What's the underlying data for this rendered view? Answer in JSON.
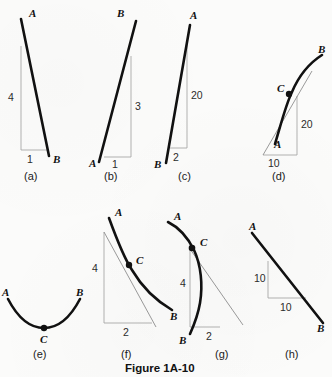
{
  "figure": {
    "caption": "Figure 1A-10",
    "background_color": "#fbfbfa",
    "ink_color": "#111111",
    "guide_color": "#a8a8a8"
  },
  "panels": [
    {
      "id": "a",
      "label": "(a)",
      "kind": "straight-line",
      "point_a": "A",
      "point_b": "B",
      "rise_label": "4",
      "run_label": "1",
      "description": "Steep line falling from A at upper left to B at lower right with rise-over-run triangle"
    },
    {
      "id": "b",
      "label": "(b)",
      "kind": "straight-line",
      "point_a": "A",
      "point_b": "B",
      "rise_label": "3",
      "run_label": "1",
      "description": "Steep line rising from A at lower left to B at upper right with rise-over-run triangle"
    },
    {
      "id": "c",
      "label": "(c)",
      "kind": "straight-line",
      "point_a": "A",
      "point_b": "B",
      "rise_label": "20",
      "run_label": "2",
      "description": "Very steep line from A at top to B at lower left with rise-over-run triangle"
    },
    {
      "id": "d",
      "label": "(d)",
      "kind": "curve-with-tangent",
      "point_a": "A",
      "point_b": "B",
      "point_c": "C",
      "rise_label": "20",
      "run_label": "10",
      "description": "Concave curve from A at lower left rising to B at upper right, tangent drawn at point C"
    },
    {
      "id": "e",
      "label": "(e)",
      "kind": "curve-minimum",
      "point_a": "A",
      "point_b": "B",
      "point_c": "C",
      "rise_label": "",
      "run_label": "",
      "description": "U-shaped valley curve from A to B with minimum point C, no measurement triangle"
    },
    {
      "id": "f",
      "label": "(f)",
      "kind": "curve-with-tangent",
      "point_a": "A",
      "point_b": "B",
      "point_c": "C",
      "rise_label": "4",
      "run_label": "2",
      "description": "Convex decreasing curve from A at upper left to B at lower right, tangent at point C"
    },
    {
      "id": "g",
      "label": "(g)",
      "kind": "curve-with-tangent",
      "point_a": "A",
      "point_b": "B",
      "point_c": "C",
      "rise_label": "4",
      "run_label": "2",
      "description": "Steeply falling curve from A at upper left through C down to B at bottom, tangent at point C"
    },
    {
      "id": "h",
      "label": "(h)",
      "kind": "straight-line",
      "point_a": "A",
      "point_b": "B",
      "rise_label": "10",
      "run_label": "10",
      "description": "Line of slope negative one from A at upper left to B at lower right with equal legs triangle"
    }
  ]
}
